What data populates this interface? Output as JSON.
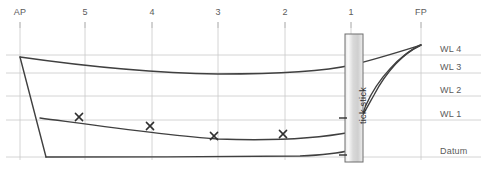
{
  "drawing": {
    "type": "sheer-plan",
    "title": "Boat sheer plan with tick stick",
    "background_color": "#ffffff",
    "line_color": "#404040",
    "grid_color": "#c9c9c9",
    "label_color": "#5b5b5b"
  },
  "stations": [
    {
      "label": "AP",
      "x": 20
    },
    {
      "label": "5",
      "x": 85
    },
    {
      "label": "4",
      "x": 152
    },
    {
      "label": "3",
      "x": 218
    },
    {
      "label": "2",
      "x": 285
    },
    {
      "label": "1",
      "x": 351
    },
    {
      "label": "FP",
      "x": 421
    }
  ],
  "waterlines": [
    {
      "label": "WL 4",
      "y": 55
    },
    {
      "label": "WL 3",
      "y": 73
    },
    {
      "label": "WL 2",
      "y": 96
    },
    {
      "label": "WL 1",
      "y": 120
    },
    {
      "label": "Datum",
      "y": 157
    }
  ],
  "tick_stick": {
    "label": "tick stick",
    "x": 345,
    "y": 34,
    "width": 18,
    "height": 128,
    "fill_light": "#f2f2f2",
    "fill_mid": "#d5d5d5",
    "border_color": "#6e6e6e",
    "marks": [
      {
        "name": "tick-mark-wl1",
        "y": 118
      },
      {
        "name": "tick-mark-datum",
        "y": 155
      }
    ]
  },
  "offset_marks": [
    {
      "label": "x",
      "x": 79,
      "y": 117
    },
    {
      "label": "x",
      "x": 150,
      "y": 126
    },
    {
      "label": "x",
      "x": 214,
      "y": 136
    },
    {
      "label": "x",
      "x": 283,
      "y": 134
    }
  ],
  "hull_curves": {
    "sheer_line": "M 20,57 C 90,67 150,73 218,74 C 290,74 330,70 352,65 C 380,58 405,50 421,45",
    "transom": "M 20,57 L 46,157",
    "keel_line": "M 46,157 C 120,157 230,157 300,156 C 325,155 340,153 352,150",
    "waterline_curve": "M 40,118 C 100,126 170,136 218,139 C 270,141 320,138 352,132",
    "stem_outer": "M 421,45 C 400,55 378,78 366,105 C 358,124 354,140 352,150",
    "stem_inner": "M 421,45 C 404,52 386,72 374,95 C 364,113 357,126 352,132"
  },
  "axis_ticks": {
    "top_tick_length": 6,
    "top_tick_y": 22
  }
}
